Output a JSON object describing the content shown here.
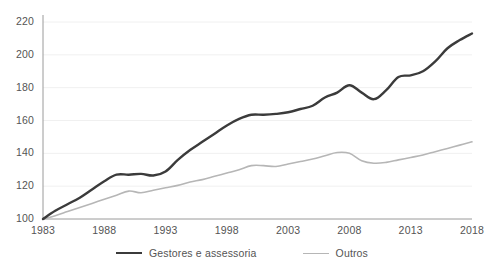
{
  "chart_data": {
    "type": "line",
    "title": "",
    "subtitle": "",
    "xlabel": "",
    "ylabel": "",
    "xlim": [
      1983,
      2018
    ],
    "ylim": [
      100,
      220
    ],
    "grid": true,
    "grid_axis": "y",
    "legend_position": "bottom",
    "x_ticks": [
      "1983",
      "1988",
      "1993",
      "1998",
      "2003",
      "2008",
      "2013",
      "2018"
    ],
    "x_tick_values": [
      1983,
      1988,
      1993,
      1998,
      2003,
      2008,
      2013,
      2018
    ],
    "y_ticks": [
      "100",
      "120",
      "140",
      "160",
      "180",
      "200",
      "220"
    ],
    "y_tick_values": [
      100,
      120,
      140,
      160,
      180,
      200,
      220
    ],
    "x": [
      1983,
      1984,
      1985,
      1986,
      1987,
      1988,
      1989,
      1990,
      1991,
      1992,
      1993,
      1994,
      1995,
      1996,
      1997,
      1998,
      1999,
      2000,
      2001,
      2002,
      2003,
      2004,
      2005,
      2006,
      2007,
      2008,
      2009,
      2010,
      2011,
      2012,
      2013,
      2014,
      2015,
      2016,
      2017,
      2018
    ],
    "series": [
      {
        "name": "Gestores e assessoria",
        "color": "#3b3b3b",
        "width": 2.4,
        "values": [
          100,
          105,
          109,
          113,
          118,
          123,
          127,
          127,
          127.5,
          126.5,
          129,
          136,
          142,
          147,
          152,
          157,
          161,
          163.5,
          163.5,
          164,
          165,
          167,
          169,
          174,
          177,
          181.5,
          177,
          173,
          178.5,
          186.5,
          187.5,
          190,
          196,
          204,
          209,
          213
        ]
      },
      {
        "name": "Outros",
        "color": "#b6b6b6",
        "width": 1.6,
        "values": [
          100,
          102,
          104.5,
          107,
          109.5,
          112,
          114.5,
          117,
          116,
          117.5,
          119,
          120.5,
          122.5,
          124,
          126,
          128,
          130,
          132.5,
          132.5,
          132,
          133.5,
          135,
          136.5,
          138.5,
          140.5,
          140,
          135.5,
          134,
          134.5,
          136,
          137.5,
          139,
          141,
          143,
          145,
          147
        ]
      }
    ]
  },
  "legend": {
    "items": [
      {
        "label": "Gestores e assessoria"
      },
      {
        "label": "Outros"
      }
    ]
  },
  "colors": {
    "series_dark": "#3b3b3b",
    "series_light": "#b6b6b6",
    "axis": "#9a9a9a",
    "grid": "#f0f0f0",
    "text": "#545454",
    "background": "#ffffff"
  }
}
